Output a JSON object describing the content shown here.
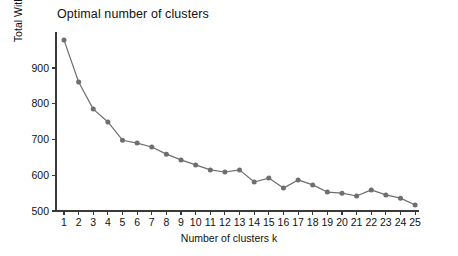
{
  "chart_data": {
    "type": "line",
    "title": "Optimal number of clusters",
    "xlabel": "Number of clusters k",
    "ylabel": "Total Within Sum of Square",
    "x": [
      1,
      2,
      3,
      4,
      5,
      6,
      7,
      8,
      9,
      10,
      11,
      12,
      13,
      14,
      15,
      16,
      17,
      18,
      19,
      20,
      21,
      22,
      23,
      24,
      25
    ],
    "values": [
      978,
      861,
      785,
      749,
      698,
      690,
      679,
      659,
      643,
      629,
      615,
      609,
      615,
      581,
      592,
      564,
      587,
      573,
      553,
      550,
      542,
      559,
      545,
      536,
      517
    ],
    "series": [
      {
        "name": "Total Within Sum of Square",
        "values": [
          978,
          861,
          785,
          749,
          698,
          690,
          679,
          659,
          643,
          629,
          615,
          609,
          615,
          581,
          592,
          564,
          587,
          573,
          553,
          550,
          542,
          559,
          545,
          536,
          517
        ]
      }
    ],
    "xlim": [
      1,
      25
    ],
    "ylim": [
      500,
      990
    ],
    "xticks": [
      "1",
      "2",
      "3",
      "4",
      "5",
      "6",
      "7",
      "8",
      "9",
      "10",
      "11",
      "12",
      "13",
      "14",
      "15",
      "16",
      "17",
      "18",
      "19",
      "20",
      "21",
      "22",
      "23",
      "24",
      "25"
    ],
    "yticks": [
      "500",
      "600",
      "700",
      "800",
      "900"
    ],
    "ytick_values": [
      500,
      600,
      700,
      800,
      900
    ],
    "grid": false,
    "legend": false,
    "marker": "filled-circle",
    "colors": {
      "line": "#6e6e6e",
      "marker": "#6e6e6e",
      "axis": "#3a3a3a",
      "text": "#111111",
      "background": "#ffffff"
    }
  }
}
